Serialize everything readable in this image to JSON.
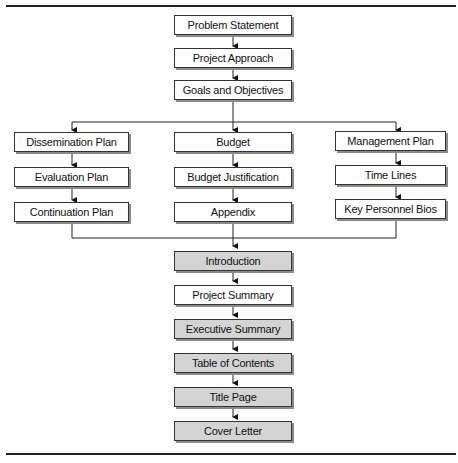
{
  "diagram": {
    "colors": {
      "box_fill": "#ffffff",
      "shaded_fill": "#d4d4d4",
      "border": "#333333",
      "shadow": "#8a8a8a"
    },
    "top_chain": [
      {
        "label": "Problem Statement"
      },
      {
        "label": "Project Approach"
      },
      {
        "label": "Goals and Objectives"
      }
    ],
    "columns": {
      "left": [
        {
          "label": "Dissemination Plan"
        },
        {
          "label": "Evaluation Plan"
        },
        {
          "label": "Continuation Plan"
        }
      ],
      "center": [
        {
          "label": "Budget"
        },
        {
          "label": "Budget Justification"
        },
        {
          "label": "Appendix"
        }
      ],
      "right": [
        {
          "label": "Management Plan"
        },
        {
          "label": "Time Lines"
        },
        {
          "label": "Key Personnel Bios"
        }
      ]
    },
    "bottom_chain": [
      {
        "label": "Introduction",
        "shaded": true
      },
      {
        "label": "Project Summary",
        "shaded": false
      },
      {
        "label": "Executive Summary",
        "shaded": true
      },
      {
        "label": "Table of Contents",
        "shaded": true
      },
      {
        "label": "Title Page",
        "shaded": true
      },
      {
        "label": "Cover Letter",
        "shaded": true
      }
    ]
  }
}
